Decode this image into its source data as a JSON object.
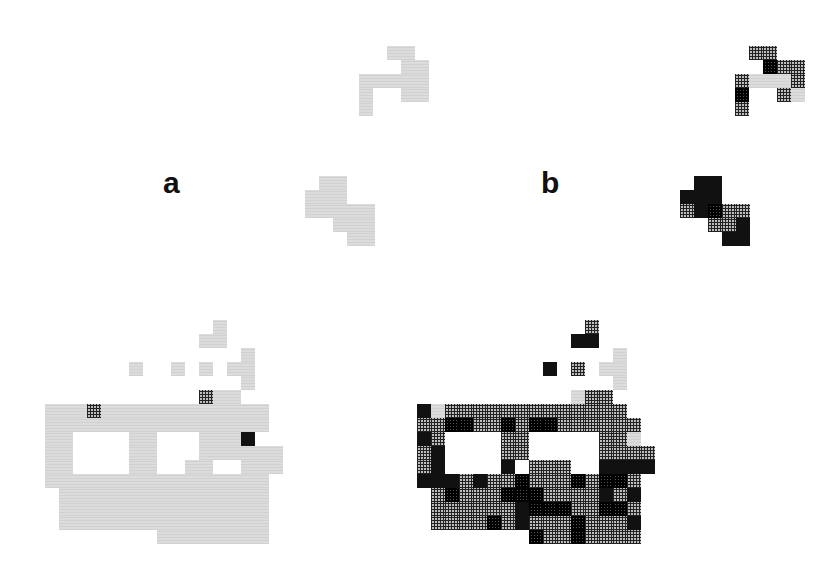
{
  "figure": {
    "panels": [
      {
        "label": "a",
        "label_pos": {
          "x": 163,
          "y": 168
        },
        "cell_size": 14,
        "legend_classes": {
          "L": "light gray (low)",
          "H": "hatched (medium)",
          "M": "dense hatched (high)",
          "D": "black (highest)"
        },
        "clusters": [
          {
            "name": "top-cluster",
            "origin": {
              "x": 359,
              "y": 46
            },
            "rows": [
              "..LL.",
              "...LL",
              "LLLLL",
              "L..LL",
              "L...."
            ]
          },
          {
            "name": "middle-cluster",
            "origin": {
              "x": 305,
              "y": 176
            },
            "rows": [
              ".LL..",
              "LLL..",
              "LLLLL",
              "..LLL",
              "...LL"
            ]
          },
          {
            "name": "bottom-cluster",
            "origin": {
              "x": 45,
              "y": 320
            },
            "rows": [
              "............L....",
              "...........LL....",
              "..............L..",
              "......L..L.L.LL..",
              "..............L..",
              "...........HLL...",
              "LLLHLLLLLLLLLLLL.",
              "LLLLLLLLLLLLLLLL.",
              "LL....LL...LLLD..",
              "LL....LL...LLLLLL",
              "LL....LL..LL..LLL",
              "LLLLLLLLLLLLLLLL.",
              ".LLLLLLLLLLLLLLL.",
              ".LLLLLLLLLLLLLLL.",
              ".LLLLLLLLLLLLLLL.",
              "........LLLLLLLL."
            ]
          }
        ]
      },
      {
        "label": "b",
        "label_pos": {
          "x": 541,
          "y": 168
        },
        "cell_size": 14,
        "clusters": [
          {
            "name": "top-cluster",
            "origin": {
              "x": 735,
              "y": 46
            },
            "rows": [
              ".HH..",
              "..MHH",
              "HLLLH",
              "M..HL",
              "H...."
            ]
          },
          {
            "name": "middle-cluster",
            "origin": {
              "x": 680,
              "y": 176
            },
            "rows": [
              ".DD..",
              "DDD..",
              "HDMHH",
              "..HHD",
              "...DD"
            ]
          },
          {
            "name": "bottom-cluster",
            "origin": {
              "x": 417,
              "y": 320
            },
            "rows": [
              "............H....",
              "...........DD....",
              "..............L..",
              ".........D.H.LL..",
              "..............L..",
              "...........LHH...",
              "DLHHHHHHHHHHHHH..",
              "HHMMHHMHMMHHHHHH.",
              "DH....HH.....HHL.",
              "HD....HH.....HHHH",
              "HD....D.HHH..DDDD",
              "DDDHDHHMHHHMHMMH.",
              ".HMHHHMMMHHHHDHD.",
              ".HHHHHHDMMMHHMMH.",
              ".HHHHMHDHHHMHHHD.",
              "........MHHMHHHH."
            ]
          }
        ]
      }
    ]
  }
}
